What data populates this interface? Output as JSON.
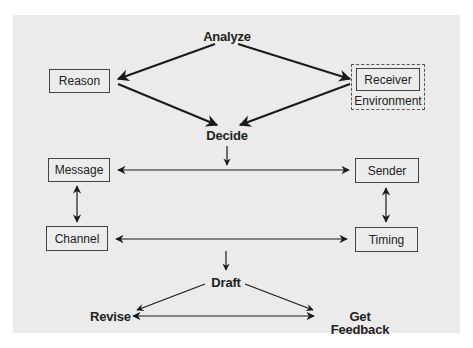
{
  "diagram": {
    "title_nodes": {
      "analyze": "Analyze",
      "decide": "Decide",
      "draft": "Draft",
      "revise": "Revise",
      "get_feedback": "Get Feedback"
    },
    "boxes": {
      "reason": "Reason",
      "receiver": "Receiver",
      "environment": "Environment",
      "message": "Message",
      "sender": "Sender",
      "channel": "Channel",
      "timing": "Timing"
    },
    "colors": {
      "panel": "#ebebeb",
      "stroke": "#1a1a1a",
      "text": "#222222"
    },
    "edges": [
      {
        "from": "Analyze",
        "to": "Reason",
        "type": "arrow"
      },
      {
        "from": "Analyze",
        "to": "Receiver",
        "type": "arrow"
      },
      {
        "from": "Reason",
        "to": "Decide",
        "type": "arrow"
      },
      {
        "from": "Receiver",
        "to": "Decide",
        "type": "arrow"
      },
      {
        "from": "Decide",
        "to": "Message-Sender line",
        "type": "arrow"
      },
      {
        "from": "Message",
        "to": "Sender",
        "type": "bidirectional"
      },
      {
        "from": "Message",
        "to": "Channel",
        "type": "bidirectional"
      },
      {
        "from": "Sender",
        "to": "Timing",
        "type": "bidirectional"
      },
      {
        "from": "Channel",
        "to": "Timing",
        "type": "bidirectional"
      },
      {
        "from": "Channel-Timing line",
        "to": "Draft",
        "type": "arrow"
      },
      {
        "from": "Draft",
        "to": "Revise",
        "type": "arrow"
      },
      {
        "from": "Draft",
        "to": "Get Feedback",
        "type": "arrow"
      },
      {
        "from": "Revise",
        "to": "Get Feedback",
        "type": "bidirectional"
      }
    ]
  }
}
